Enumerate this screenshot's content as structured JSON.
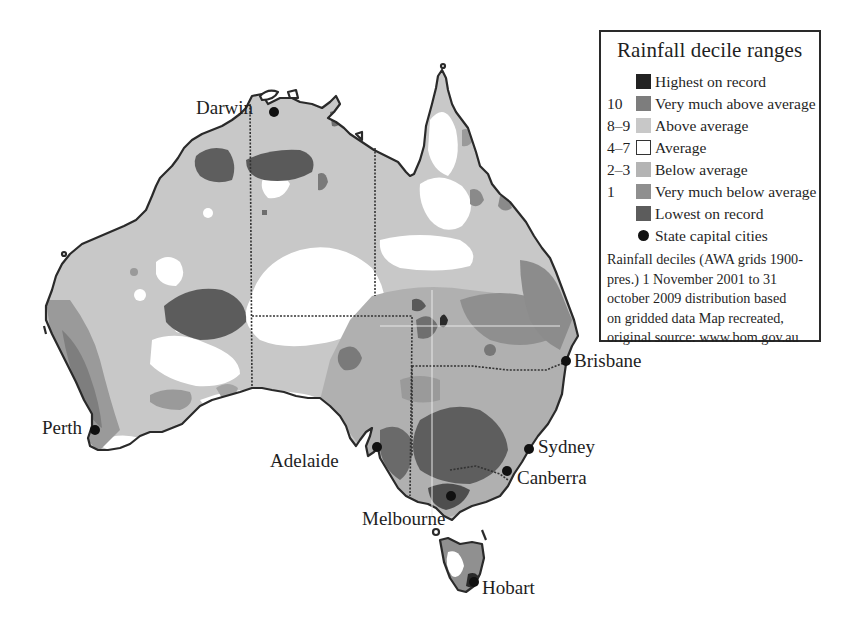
{
  "map": {
    "title": "Rainfall decile ranges",
    "region": "Australia",
    "colors": {
      "highest_on_record": "#222222",
      "very_much_above_average": "#7d7d7d",
      "above_average": "#c8c8c8",
      "average": "#ffffff",
      "below_average": "#b4b4b4",
      "very_much_below_average": "#8f8f8f",
      "lowest_on_record": "#5c5c5c",
      "coastline": "#2a2a2a",
      "state_border": "#333333",
      "city_marker": "#111111"
    },
    "cities": [
      {
        "name": "Darwin",
        "x": 274,
        "y": 112
      },
      {
        "name": "Brisbane",
        "x": 566,
        "y": 361
      },
      {
        "name": "Perth",
        "x": 95,
        "y": 430
      },
      {
        "name": "Adelaide",
        "x": 377,
        "y": 447
      },
      {
        "name": "Sydney",
        "x": 529,
        "y": 449
      },
      {
        "name": "Canberra",
        "x": 507,
        "y": 471
      },
      {
        "name": "Melbourne",
        "x": 451,
        "y": 496
      },
      {
        "name": "Hobart",
        "x": 474,
        "y": 582
      }
    ]
  },
  "legend": {
    "title": "Rainfall decile ranges",
    "items": [
      {
        "code": "",
        "label": "Highest on record",
        "color": "#222222",
        "kind": "swatch"
      },
      {
        "code": "10",
        "label": "Very much above average",
        "color": "#7d7d7d",
        "kind": "swatch"
      },
      {
        "code": "8–9",
        "label": "Above average",
        "color": "#c8c8c8",
        "kind": "swatch"
      },
      {
        "code": "4–7",
        "label": "Average",
        "color": "#ffffff",
        "kind": "outline"
      },
      {
        "code": "2–3",
        "label": "Below average",
        "color": "#b4b4b4",
        "kind": "swatch"
      },
      {
        "code": "1",
        "label": "Very much below average",
        "color": "#8f8f8f",
        "kind": "swatch"
      },
      {
        "code": "",
        "label": "Lowest on record",
        "color": "#5c5c5c",
        "kind": "swatch"
      },
      {
        "code": "",
        "label": "State capital cities",
        "color": "#111111",
        "kind": "dot"
      }
    ],
    "note_lines": [
      "Rainfall deciles (AWA grids 1900-",
      "pres.) 1 November 2001 to 31",
      "october 2009 distribution based",
      "on gridded data Map recreated,",
      "original source: www.bom.gov.au"
    ]
  },
  "labels": {
    "darwin": "Darwin",
    "brisbane": "Brisbane",
    "perth": "Perth",
    "adelaide": "Adelaide",
    "sydney": "Sydney",
    "canberra": "Canberra",
    "melbourne": "Melbourne",
    "hobart": "Hobart"
  }
}
